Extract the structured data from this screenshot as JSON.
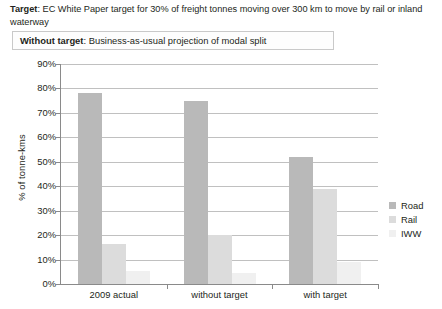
{
  "target_note": {
    "label": "Target",
    "text": ": EC White Paper target for 30% of freight tonnes moving over 300 km to move by rail or inland waterway"
  },
  "without_target_box": {
    "label": "Without target",
    "text": ": Business-as-usual projection of modal split"
  },
  "legend": {
    "items": [
      {
        "label": "Road",
        "color": "#b9b9b9",
        "icon": "legend-swatch-road"
      },
      {
        "label": "Rail",
        "color": "#dcdcdc",
        "icon": "legend-swatch-rail"
      },
      {
        "label": "IWW",
        "color": "#f0f0f0",
        "icon": "legend-swatch-iww"
      }
    ]
  },
  "chart_data": {
    "type": "bar",
    "title": "",
    "xlabel": "",
    "ylabel": "% of tonne-kms",
    "ylim": [
      0,
      90
    ],
    "ytick_labels": [
      "90%",
      "80%",
      "70%",
      "60%",
      "50%",
      "40%",
      "30%",
      "20%",
      "10%",
      "0%"
    ],
    "ytick_values": [
      90,
      80,
      70,
      60,
      50,
      40,
      30,
      20,
      10,
      0
    ],
    "grid": true,
    "legend_position": "right",
    "categories": [
      "2009 actual",
      "without target",
      "with target"
    ],
    "series": [
      {
        "name": "Road",
        "color": "#b9b9b9",
        "values": [
          78,
          75,
          52
        ]
      },
      {
        "name": "Rail",
        "color": "#dcdcdc",
        "values": [
          16.5,
          20,
          39
        ]
      },
      {
        "name": "IWW",
        "color": "#f0f0f0",
        "values": [
          5.5,
          4.5,
          9
        ]
      }
    ]
  }
}
